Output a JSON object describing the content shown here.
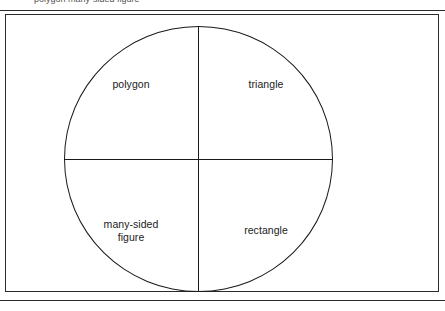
{
  "page": {
    "running_head": "polygon many-sided figure",
    "background_color": "#ffffff",
    "rule_color": "#2b2b2b",
    "line_color": "#1a1a1a"
  },
  "figure": {
    "shape": "circle",
    "divisions": 4,
    "quadrants": [
      {
        "position": "upper-left",
        "label": "polygon"
      },
      {
        "position": "upper-right",
        "label": "triangle"
      },
      {
        "position": "lower-left",
        "label": "many-sided\nfigure"
      },
      {
        "position": "lower-right",
        "label": "rectangle"
      }
    ]
  }
}
